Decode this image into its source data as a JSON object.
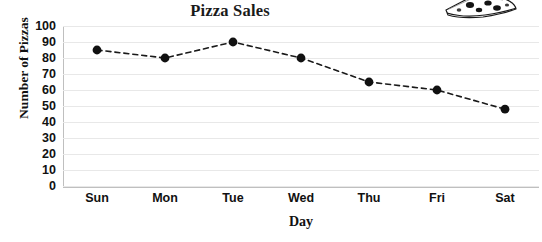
{
  "chart_data": {
    "type": "line",
    "title": "Pizza Sales",
    "xlabel": "Day",
    "ylabel": "Number of Pizzas",
    "categories": [
      "Sun",
      "Mon",
      "Tue",
      "Wed",
      "Thu",
      "Fri",
      "Sat"
    ],
    "values": [
      85,
      80,
      90,
      80,
      65,
      60,
      48
    ],
    "series": [
      {
        "name": "Pizza Sales",
        "values": [
          85,
          80,
          90,
          80,
          65,
          60,
          48
        ]
      }
    ],
    "ylim": [
      0,
      100
    ],
    "ytick_step": 10,
    "yticks": [
      100,
      90,
      80,
      70,
      60,
      50,
      40,
      30,
      20,
      10,
      0
    ],
    "grid": true,
    "grid_axis": "horizontal",
    "legend": "none",
    "line_style": "dashed",
    "marker": "circle",
    "line_color": "#1a1a1a",
    "marker_color": "#111111",
    "grid_color": "#e8e8e8",
    "axis_color": "#bfbfbf"
  },
  "decoration": {
    "pizza_icon_name": "pizza-slice-clipart"
  }
}
